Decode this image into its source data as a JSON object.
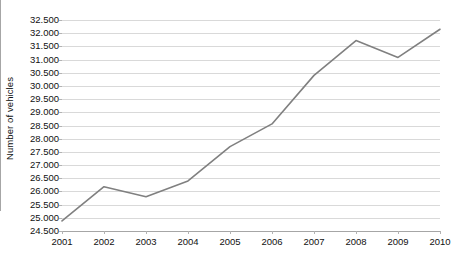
{
  "chart_data": {
    "type": "line",
    "title": "",
    "subtitle": "",
    "xlabel": "",
    "ylabel": "Number of vehicles",
    "categories": [
      "2001",
      "2002",
      "2003",
      "2004",
      "2005",
      "2006",
      "2007",
      "2008",
      "2009",
      "2010"
    ],
    "x": [
      2001,
      2002,
      2003,
      2004,
      2005,
      2006,
      2007,
      2008,
      2009,
      2010
    ],
    "values": [
      24880,
      26180,
      25800,
      26400,
      27700,
      28560,
      30400,
      31720,
      31080,
      32150
    ],
    "value_labels": [
      "24.880",
      "26.180",
      "25.800",
      "26.400",
      "27.700",
      "28.560",
      "30.400",
      "31.720",
      "31.080",
      "32.150"
    ],
    "series": [
      {
        "name": "Number of vehicles",
        "color": "#808080",
        "values": [
          24880,
          26180,
          25800,
          26400,
          27700,
          28560,
          30400,
          31720,
          31080,
          32150
        ]
      }
    ],
    "ylim": [
      24500,
      32500
    ],
    "ytick_values": [
      24500,
      25000,
      25500,
      26000,
      26500,
      27000,
      27500,
      28000,
      28500,
      29000,
      29500,
      30000,
      30500,
      31000,
      31500,
      32000,
      32500
    ],
    "ytick_labels": [
      "24.500",
      "25.000",
      "25.500",
      "26.000",
      "26.500",
      "27.000",
      "27.500",
      "28.000",
      "28.500",
      "29.000",
      "29.500",
      "30.000",
      "30.500",
      "31.000",
      "31.500",
      "32.000",
      "32.500"
    ],
    "ytick_step": 500,
    "grid": true,
    "grid_axis": "y",
    "grid_color": "#d9d9d9",
    "legend": false,
    "legend_position": "none",
    "axis_color": "#a6a6a6",
    "text_color": "#111111",
    "background": "#ffffff",
    "annotations": []
  }
}
